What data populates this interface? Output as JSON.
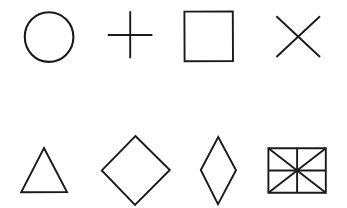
{
  "canvas": {
    "width": 347,
    "height": 208,
    "background_color": "#ffffff",
    "stroke_color": "#1a1a1a",
    "stroke_width": 2,
    "style": "line-drawing",
    "fill": "none"
  },
  "layout": {
    "rows": 2,
    "columns": 4,
    "total_shapes": 8
  },
  "shapes": [
    {
      "index": 0,
      "row": 0,
      "column": 0,
      "name": "circle",
      "label": "Circle",
      "geometry": "ellipse",
      "center": [
        49,
        37
      ],
      "radius_x": 24,
      "radius_y": 25,
      "bbox": [
        25,
        12,
        49,
        50
      ]
    },
    {
      "index": 1,
      "row": 0,
      "column": 1,
      "name": "plus",
      "label": "Plus / Cross",
      "geometry": "two-perpendicular-segments",
      "center": [
        130,
        35
      ],
      "vertical_span": [
        11,
        58
      ],
      "horizontal_span": [
        108,
        152
      ],
      "bbox": [
        108,
        11,
        44,
        47
      ]
    },
    {
      "index": 2,
      "row": 0,
      "column": 2,
      "name": "square",
      "label": "Square",
      "geometry": "rectangle",
      "bbox": [
        184,
        11,
        49,
        50
      ],
      "corners": [
        [
          184,
          11
        ],
        [
          233,
          11
        ],
        [
          233,
          61
        ],
        [
          184,
          61
        ]
      ]
    },
    {
      "index": 3,
      "row": 0,
      "column": 3,
      "name": "x-cross",
      "label": "X / Saltire",
      "geometry": "two-diagonal-segments",
      "center": [
        298,
        36
      ],
      "bbox": [
        276,
        16,
        44,
        41
      ],
      "corners": [
        [
          276,
          16
        ],
        [
          320,
          57
        ],
        [
          320,
          16
        ],
        [
          276,
          57
        ]
      ]
    },
    {
      "index": 4,
      "row": 1,
      "column": 0,
      "name": "triangle",
      "label": "Triangle",
      "geometry": "polygon",
      "bbox": [
        21,
        148,
        46,
        44
      ],
      "vertices": [
        [
          44,
          148
        ],
        [
          67,
          192
        ],
        [
          21,
          192
        ]
      ]
    },
    {
      "index": 5,
      "row": 1,
      "column": 1,
      "name": "diamond",
      "label": "Diamond / Rotated Square",
      "geometry": "polygon",
      "bbox": [
        102,
        136,
        68,
        69
      ],
      "vertices": [
        [
          135,
          136
        ],
        [
          170,
          170
        ],
        [
          135,
          205
        ],
        [
          102,
          170
        ]
      ]
    },
    {
      "index": 6,
      "row": 1,
      "column": 2,
      "name": "rhombus",
      "label": "Rhombus / Narrow Diamond",
      "geometry": "polygon",
      "bbox": [
        201,
        137,
        35,
        67
      ],
      "vertices": [
        [
          218,
          137
        ],
        [
          236,
          170
        ],
        [
          218,
          204
        ],
        [
          201,
          170
        ]
      ]
    },
    {
      "index": 7,
      "row": 1,
      "column": 3,
      "name": "divided-rectangle",
      "label": "Rectangle with Diagonals and Midlines",
      "geometry": "rectangle-with-8-sectors",
      "bbox": [
        268,
        148,
        58,
        45
      ],
      "corners": [
        [
          268,
          148
        ],
        [
          326,
          148
        ],
        [
          326,
          193
        ],
        [
          268,
          193
        ]
      ],
      "internal_lines": [
        "vertical-midline",
        "horizontal-midline",
        "diagonal-tl-br",
        "diagonal-tr-bl"
      ],
      "sector_count": 8,
      "center_dot": [
        297,
        170
      ]
    }
  ]
}
